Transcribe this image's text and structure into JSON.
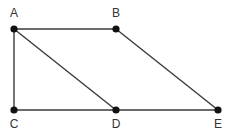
{
  "diagram": {
    "type": "graph",
    "nodes": [
      {
        "id": "A",
        "label": "A"
      },
      {
        "id": "B",
        "label": "B"
      },
      {
        "id": "C",
        "label": "C"
      },
      {
        "id": "D",
        "label": "D"
      },
      {
        "id": "E",
        "label": "E"
      }
    ],
    "edges": [
      {
        "from": "A",
        "to": "B"
      },
      {
        "from": "A",
        "to": "C"
      },
      {
        "from": "A",
        "to": "D"
      },
      {
        "from": "B",
        "to": "E"
      },
      {
        "from": "C",
        "to": "D"
      },
      {
        "from": "D",
        "to": "E"
      }
    ]
  }
}
